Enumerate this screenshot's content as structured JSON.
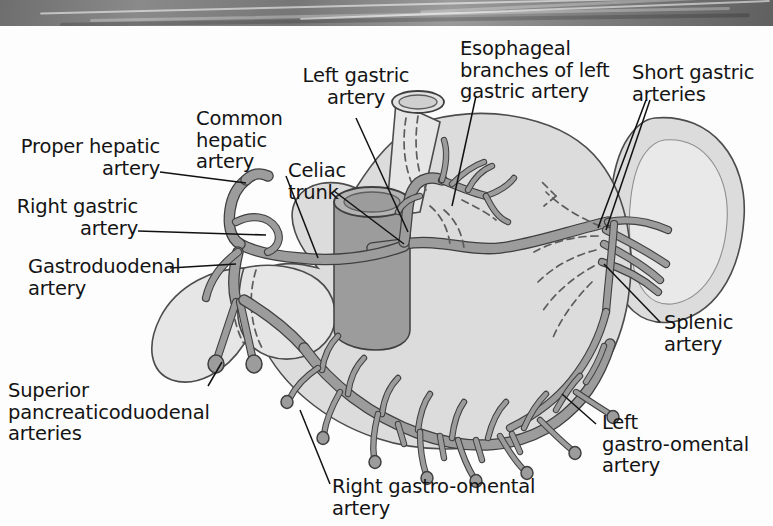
{
  "figure": {
    "type": "anatomical-diagram",
    "background_color": "#fdfdfd",
    "artery_color": "#9a9a9a",
    "artery_outline_color": "#4a4a4a",
    "organ_fill_color": "#d8d8d8",
    "organ_outline_color": "#4a4a4a",
    "label_color": "#141414"
  },
  "banner": {
    "name": "decorative-header-band",
    "color_dark": "#606060",
    "color_light": "#9b9b9b"
  },
  "labels": [
    {
      "id": "proper-hepatic-artery",
      "text": "Proper hepatic\nartery"
    },
    {
      "id": "right-gastric-artery",
      "text": "Right gastric\nartery"
    },
    {
      "id": "gastroduodenal-artery",
      "text": "Gastroduodenal\nartery"
    },
    {
      "id": "common-hepatic-artery",
      "text": "Common\nhepatic\nartery"
    },
    {
      "id": "celiac-trunk",
      "text": "Celiac\ntrunk"
    },
    {
      "id": "left-gastric-artery",
      "text": "Left gastric\nartery"
    },
    {
      "id": "esophageal-branches",
      "text": "Esophageal\nbranches of left\ngastric artery"
    },
    {
      "id": "short-gastric-arteries",
      "text": "Short gastric\narteries"
    },
    {
      "id": "splenic-artery",
      "text": "Splenic\nartery"
    },
    {
      "id": "left-gastro-omental-artery",
      "text": "Left\ngastro-omental\nartery"
    },
    {
      "id": "right-gastro-omental-artery",
      "text": "Right gastro-omental artery"
    },
    {
      "id": "superior-pancreaticoduodenal-arteries",
      "text": "Superior\npancreaticoduodenal\narteries"
    }
  ],
  "structures": [
    {
      "id": "stomach",
      "name": "stomach"
    },
    {
      "id": "spleen",
      "name": "spleen"
    },
    {
      "id": "duodenum",
      "name": "duodenum"
    },
    {
      "id": "esophagus",
      "name": "esophagus"
    },
    {
      "id": "aorta",
      "name": "abdominal-aorta"
    }
  ]
}
